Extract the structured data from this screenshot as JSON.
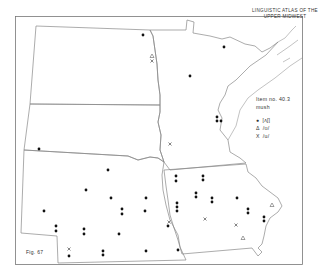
{
  "title": {
    "line1": "LINGUISTIC ATLAS OF THE",
    "line2": "UPPER MIDWEST"
  },
  "legend": {
    "item": "Item no. 40.3",
    "word": "mush",
    "entries": [
      {
        "symbol": "●",
        "icon": "dot-icon",
        "label": "[ʌʃ]"
      },
      {
        "symbol": "Δ",
        "icon": "triangle-icon",
        "label": "/ʊ/"
      },
      {
        "symbol": "X",
        "icon": "cross-icon",
        "label": "/u/"
      }
    ]
  },
  "figure_label": "Fig. 67",
  "states": [
    "North Dakota",
    "South Dakota",
    "Nebraska",
    "Minnesota",
    "Iowa"
  ],
  "markers": {
    "dots": [
      [
        143,
        35
      ],
      [
        224,
        41
      ],
      [
        59,
        65
      ],
      [
        39,
        148
      ],
      [
        108,
        170
      ],
      [
        86,
        190
      ],
      [
        111,
        198
      ],
      [
        146,
        198
      ],
      [
        44,
        211
      ],
      [
        122,
        210
      ],
      [
        122,
        214
      ],
      [
        145,
        211
      ],
      [
        56,
        226
      ],
      [
        56,
        231
      ],
      [
        84,
        229
      ],
      [
        84,
        233
      ],
      [
        119,
        234
      ],
      [
        69,
        254
      ],
      [
        103,
        251
      ],
      [
        103,
        255
      ],
      [
        146,
        250
      ],
      [
        176,
        176
      ],
      [
        176,
        181
      ],
      [
        203,
        176
      ],
      [
        203,
        181
      ],
      [
        196,
        194
      ],
      [
        196,
        198
      ],
      [
        176,
        203
      ],
      [
        176,
        207
      ],
      [
        176,
        211
      ],
      [
        213,
        198
      ],
      [
        213,
        202
      ],
      [
        236,
        198
      ],
      [
        248,
        210
      ],
      [
        248,
        214
      ],
      [
        265,
        220
      ],
      [
        265,
        224
      ],
      [
        237,
        172
      ],
      [
        217,
        180
      ],
      [
        217,
        180
      ],
      [
        170,
        237
      ],
      [
        178,
        251
      ],
      [
        238,
        119
      ],
      [
        243,
        119
      ],
      [
        238,
        123
      ],
      [
        245,
        123
      ]
    ],
    "triangles": [
      [
        152,
        56
      ],
      [
        272,
        205
      ],
      [
        243,
        238
      ]
    ],
    "crosses": [
      [
        152,
        61
      ],
      [
        170,
        144
      ],
      [
        69,
        249
      ],
      [
        168,
        228
      ],
      [
        204,
        219
      ],
      [
        236,
        225
      ]
    ]
  }
}
